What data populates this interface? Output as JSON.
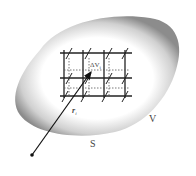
{
  "diagram": {
    "type": "volume-element-illustration",
    "labels": {
      "element": "ΔV",
      "element_sub": "i",
      "position_vector": "r",
      "position_sub": "i",
      "surface": "S",
      "volume": "V"
    },
    "grid": {
      "columns": 3,
      "rows": 2
    },
    "colors": {
      "region_fill_outer": "#8a8a8a",
      "region_fill_inner": "#ffffff",
      "lines": "#222222",
      "text": "#444444"
    }
  }
}
